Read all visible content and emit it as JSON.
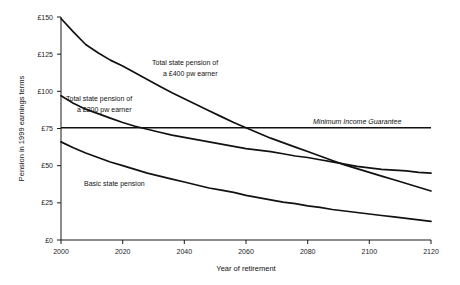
{
  "chart_data": {
    "type": "line",
    "title": "",
    "xlabel": "Year of retirement",
    "ylabel": "Pension in 1999 earnings terms",
    "xlim": [
      2000,
      2120
    ],
    "ylim": [
      0,
      150
    ],
    "xticks": [
      2000,
      2020,
      2040,
      2060,
      2080,
      2100,
      2120
    ],
    "xtick_labels": [
      "2000",
      "2020",
      "2040",
      "2060",
      "2080",
      "2100",
      "2120"
    ],
    "yticks": [
      0,
      25,
      50,
      75,
      100,
      125,
      150
    ],
    "ytick_labels": [
      "£0",
      "£25",
      "£50",
      "£75",
      "£100",
      "£125",
      "£150"
    ],
    "grid": false,
    "legend": "inline-annotations",
    "currency": "£",
    "series": [
      {
        "name": "Total state pension of a £400 pw earner",
        "label_line1": "Total state pension of",
        "label_line2": "a £400 pw earner",
        "color": "#111111",
        "x": [
          2000,
          2004,
          2008,
          2012,
          2016,
          2020,
          2024,
          2028,
          2032,
          2036,
          2040,
          2044,
          2048,
          2052,
          2056,
          2060,
          2064,
          2068,
          2072,
          2076,
          2080,
          2084,
          2088,
          2092,
          2096,
          2100,
          2104,
          2108,
          2112,
          2116,
          2120
        ],
        "values": [
          149,
          140,
          131.5,
          126,
          121,
          117,
          112.5,
          108,
          103.5,
          99,
          95,
          91,
          87,
          83,
          79,
          75.5,
          72,
          68.5,
          65.5,
          62.5,
          59.5,
          56.5,
          53.5,
          50.5,
          48,
          45.5,
          43,
          40.5,
          38,
          35.5,
          33
        ]
      },
      {
        "name": "Total state pension of a £200 pw earner",
        "label_line1": "Total state pension of",
        "label_line2": "a £200 pw earner",
        "color": "#111111",
        "x": [
          2000,
          2004,
          2008,
          2012,
          2016,
          2020,
          2024,
          2028,
          2032,
          2036,
          2040,
          2044,
          2048,
          2052,
          2056,
          2060,
          2064,
          2068,
          2072,
          2076,
          2080,
          2084,
          2088,
          2092,
          2096,
          2100,
          2104,
          2108,
          2112,
          2116,
          2120
        ],
        "values": [
          97,
          92,
          88,
          85,
          82,
          79,
          76.5,
          74.5,
          72.5,
          70.5,
          69,
          67.5,
          66,
          64.5,
          63,
          61.5,
          60.5,
          59.5,
          58,
          56.5,
          55.5,
          54,
          52.5,
          51,
          49.5,
          48.5,
          47.5,
          47,
          46.5,
          45.5,
          45
        ]
      },
      {
        "name": "Basic state pension",
        "label_line1": "Basic state pension",
        "label_line2": "",
        "color": "#111111",
        "x": [
          2000,
          2004,
          2008,
          2012,
          2016,
          2020,
          2024,
          2028,
          2032,
          2036,
          2040,
          2044,
          2048,
          2052,
          2056,
          2060,
          2064,
          2068,
          2072,
          2076,
          2080,
          2084,
          2088,
          2092,
          2096,
          2100,
          2104,
          2108,
          2112,
          2116,
          2120
        ],
        "values": [
          66,
          62,
          58.5,
          55.5,
          52.5,
          50,
          47.5,
          45,
          43,
          41,
          39,
          37,
          35,
          33.5,
          32,
          30,
          28.5,
          27,
          25.5,
          24.5,
          23,
          22,
          20.5,
          19.5,
          18.5,
          17.5,
          16.5,
          15.5,
          14.5,
          13.5,
          12.5
        ]
      }
    ],
    "reference_lines": [
      {
        "name": "Minimum Income Guarantee",
        "label": "Minimum Income Guarantee",
        "value": 75.5,
        "orientation": "horizontal",
        "style": "solid",
        "color": "#111111"
      }
    ]
  }
}
